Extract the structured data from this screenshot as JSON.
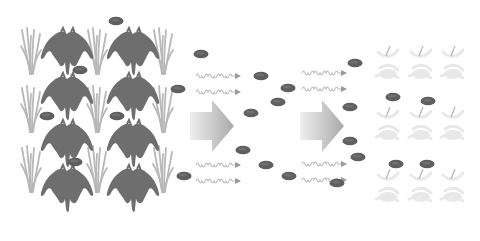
{
  "diagram": {
    "title": "",
    "stages": [
      {
        "id": "healthy-crop",
        "label": ""
      },
      {
        "id": "pathogen-spread",
        "label": ""
      },
      {
        "id": "diseased-crop",
        "label": ""
      }
    ],
    "colors": {
      "background": "#ffffff",
      "grass": "#b8b8b8",
      "plant": "#6e6e6e",
      "bacterium": "#5f5f5f",
      "wave": "#bdbdbd",
      "arrow_light": "#efefef",
      "arrow_dark": "#a9a9a9",
      "dead_plant": "#e6e6e6"
    },
    "grass_positions": [
      [
        30,
        30
      ],
      [
        96,
        30
      ],
      [
        162,
        30
      ],
      [
        30,
        88
      ],
      [
        96,
        88
      ],
      [
        162,
        88
      ],
      [
        30,
        148
      ],
      [
        96,
        148
      ],
      [
        162,
        148
      ]
    ],
    "plant_positions": [
      [
        67,
        48
      ],
      [
        133,
        48
      ],
      [
        67,
        93
      ],
      [
        133,
        93
      ],
      [
        67,
        140
      ],
      [
        133,
        140
      ],
      [
        67,
        185
      ],
      [
        133,
        185
      ]
    ],
    "bacteria_positions": [
      [
        116,
        21
      ],
      [
        80,
        70
      ],
      [
        47,
        116
      ],
      [
        117,
        116
      ],
      [
        75,
        162
      ],
      [
        178,
        89
      ],
      [
        201,
        54
      ],
      [
        184,
        176
      ],
      [
        261,
        76
      ],
      [
        288,
        88
      ],
      [
        278,
        102
      ],
      [
        251,
        113
      ],
      [
        243,
        150
      ],
      [
        266,
        165
      ],
      [
        289,
        176
      ],
      [
        337,
        183
      ],
      [
        355,
        63
      ],
      [
        350,
        107
      ],
      [
        350,
        141
      ],
      [
        358,
        157
      ],
      [
        393,
        97
      ],
      [
        428,
        101
      ],
      [
        396,
        164
      ],
      [
        427,
        164
      ]
    ],
    "waves": [
      {
        "x": 196,
        "y": 76
      },
      {
        "x": 196,
        "y": 92
      },
      {
        "x": 302,
        "y": 73
      },
      {
        "x": 302,
        "y": 89
      },
      {
        "x": 196,
        "y": 165
      },
      {
        "x": 196,
        "y": 181
      },
      {
        "x": 302,
        "y": 164
      },
      {
        "x": 302,
        "y": 180
      }
    ],
    "big_arrows": [
      {
        "x": 190,
        "y": 104
      },
      {
        "x": 300,
        "y": 104
      }
    ],
    "dead_plant_positions": [
      [
        388,
        62
      ],
      [
        421,
        62
      ],
      [
        453,
        62
      ],
      [
        388,
        123
      ],
      [
        421,
        123
      ],
      [
        453,
        123
      ],
      [
        388,
        185
      ],
      [
        421,
        185
      ],
      [
        453,
        185
      ]
    ]
  }
}
